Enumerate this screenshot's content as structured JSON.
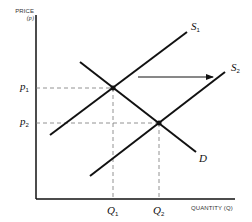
{
  "diagram": {
    "type": "supply-demand-shift",
    "y_axis": {
      "label_line1": "PRICE",
      "label_line2": "(p)"
    },
    "x_axis": {
      "label": "QUANTITY (Q)"
    },
    "curves": {
      "supply_1": {
        "label": "S",
        "sub": "1"
      },
      "supply_2": {
        "label": "S",
        "sub": "2"
      },
      "demand": {
        "label": "D"
      }
    },
    "prices": [
      {
        "label": "p",
        "sub": "1"
      },
      {
        "label": "p",
        "sub": "2"
      }
    ],
    "quantities": [
      {
        "label": "Q",
        "sub": "1"
      },
      {
        "label": "Q",
        "sub": "2"
      }
    ],
    "shift_arrow": {
      "direction": "right"
    },
    "colors": {
      "line": "#111111",
      "dashed": "#777777"
    }
  }
}
